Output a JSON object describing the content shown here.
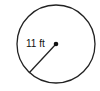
{
  "diagram": {
    "shape": "circle",
    "radius_label": "11 ft",
    "stroke_color": "#222222",
    "background": "#ffffff"
  }
}
